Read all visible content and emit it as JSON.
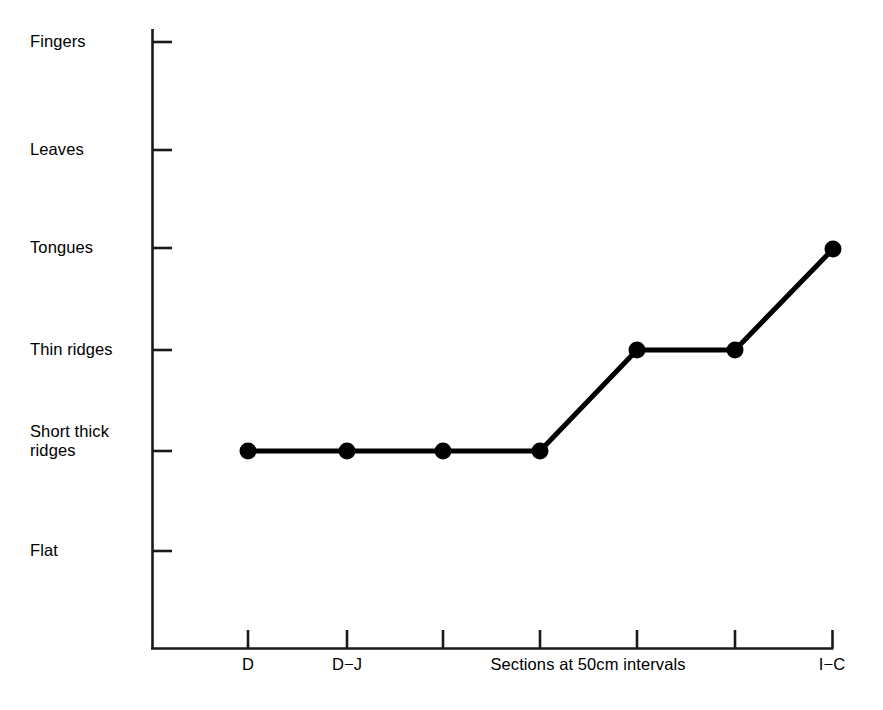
{
  "chart_data": {
    "type": "line",
    "title": "",
    "subtitle": "",
    "xlabel": "Sections at 50cm intervals",
    "ylabel": "",
    "grid": false,
    "legend": null,
    "y_categories": [
      "Fingers",
      "Leaves",
      "Tongues",
      "Thin ridges",
      "Short thick\nridges",
      "Flat"
    ],
    "y_order_top_to_bottom": [
      "Fingers",
      "Leaves",
      "Tongues",
      "Thin ridges",
      "Short thick ridges",
      "Flat"
    ],
    "x_tick_labels": [
      "D",
      "D−J",
      "",
      "",
      "",
      "",
      "I−C"
    ],
    "x_tick_count": 7,
    "series": [
      {
        "name": "surface morphology",
        "x": [
          "D",
          "D−J",
          "",
          "",
          "",
          "",
          "I−C"
        ],
        "values": [
          "Short thick ridges",
          "Short thick ridges",
          "Short thick ridges",
          "Short thick ridges",
          "Thin ridges",
          "Thin ridges",
          "Tongues"
        ],
        "marker": "filled-circle",
        "color": "#000000"
      }
    ],
    "colors": {
      "line": "#000000",
      "marker": "#000000",
      "axis": "#1a1a1a",
      "background": "#ffffff",
      "text": "#000000"
    },
    "geometry": {
      "axis_x": 152,
      "axis_y_top": 29,
      "axis_y_bottom": 648,
      "axis_x_right": 833,
      "y_tick_y": [
        42,
        150,
        248,
        350,
        451,
        551
      ],
      "x_tick_x": [
        248,
        347,
        443,
        540,
        637,
        735,
        833
      ],
      "point_y": [
        451,
        451,
        451,
        451,
        350,
        350,
        249
      ],
      "marker_radius": 8.5,
      "line_width": 5
    }
  },
  "labels": {
    "y": [
      {
        "text": "Fingers",
        "x": 30,
        "y": 32
      },
      {
        "text": "Leaves",
        "x": 30,
        "y": 140
      },
      {
        "text": "Tongues",
        "x": 30,
        "y": 238
      },
      {
        "text": "Thin ridges",
        "x": 30,
        "y": 340
      },
      {
        "text": "Short thick\nridges",
        "x": 30,
        "y": 422
      },
      {
        "text": "Flat",
        "x": 30,
        "y": 541
      }
    ],
    "x": [
      {
        "text": "D",
        "cx": 248,
        "y": 655
      },
      {
        "text": "D−J",
        "cx": 347,
        "y": 655
      },
      {
        "text": "I−C",
        "cx": 832,
        "y": 655
      }
    ],
    "axis_title": {
      "text": "Sections at 50cm intervals",
      "cx": 588,
      "y": 655
    }
  }
}
